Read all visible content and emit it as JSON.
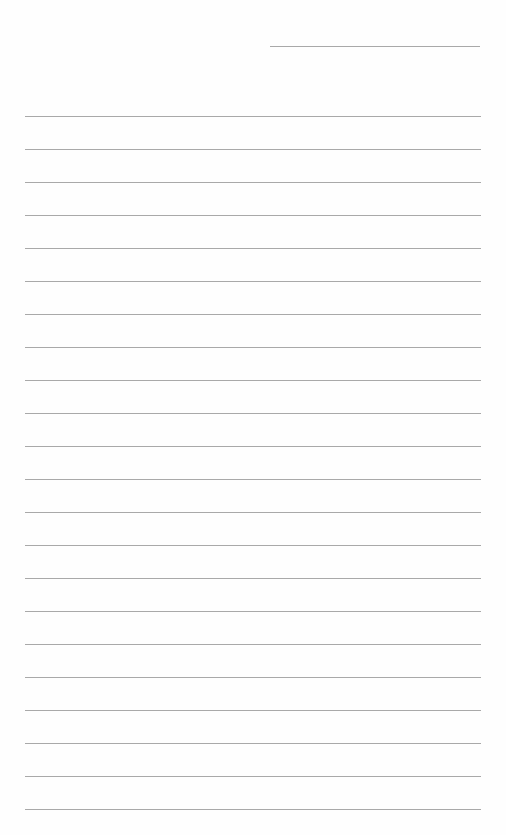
{
  "page": {
    "type": "lined-paper",
    "background_color": "#fefefe",
    "line_color": "#a9a9a9",
    "header_line": {
      "x": 270,
      "y": 46,
      "width": 210
    },
    "ruled_lines": {
      "count": 22,
      "x_start": 25,
      "x_end": 481,
      "first_y": 116,
      "spacing": 33
    }
  }
}
